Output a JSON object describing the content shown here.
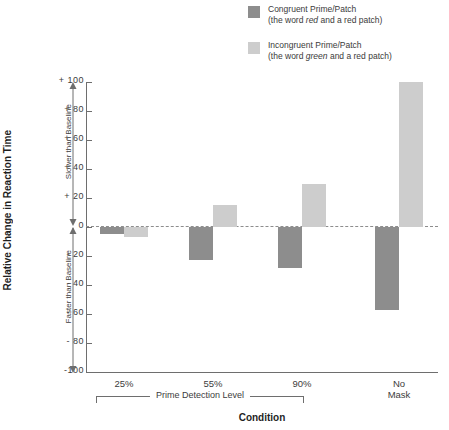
{
  "legend": {
    "position": "top-right",
    "entries": [
      {
        "label": "Congruent Prime/Patch",
        "sub_pre": "(the word ",
        "sub_em": "red",
        "sub_post": " and a red patch)",
        "color": "#8d8d8d",
        "swatch_name": "legend-swatch-congruent"
      },
      {
        "label": "Incongruent Prime/Patch",
        "sub_pre": "(the word ",
        "sub_em": "green",
        "sub_post": " and a red patch)",
        "color": "#cdcdcd",
        "swatch_name": "legend-swatch-incongruent"
      }
    ]
  },
  "annotations": {
    "slower": "Slower than Baseline",
    "faster": "Faster than Baseline",
    "group_bracket_label": "Prime Detection Level"
  },
  "chart_data": {
    "type": "bar",
    "title": "",
    "xlabel": "Condition",
    "ylabel": "Relative Change in Reaction Time",
    "categories": [
      "25%",
      "55%",
      "90%",
      "No Mask"
    ],
    "category_lines": [
      [
        "25%"
      ],
      [
        "55%"
      ],
      [
        "90%"
      ],
      [
        "No",
        "Mask"
      ]
    ],
    "series": [
      {
        "name": "Congruent Prime/Patch",
        "color": "#8d8d8d",
        "values": [
          -5,
          -23,
          -28,
          -57
        ]
      },
      {
        "name": "Incongruent Prime/Patch",
        "color": "#cdcdcd",
        "values": [
          -7,
          15,
          30,
          100
        ]
      }
    ],
    "ylim": [
      -100,
      100
    ],
    "yticks": [
      100,
      80,
      60,
      40,
      20,
      0,
      -20,
      -40,
      -60,
      -80,
      -100
    ],
    "ytick_labels": [
      "+ 100",
      "+  80",
      "+  60",
      "+  40",
      "+  20",
      "0",
      "-  20",
      "-  40",
      "-  60",
      "-  80",
      "-100"
    ],
    "grid": false,
    "zero_reference_line": true,
    "legend_position": "top-right"
  }
}
